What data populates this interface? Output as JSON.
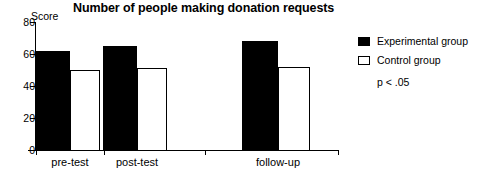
{
  "chart_data": {
    "type": "bar",
    "title": "Number of people making donation requests",
    "xlabel": "",
    "ylabel": "Score",
    "ylim": [
      0,
      80
    ],
    "yticks": [
      0,
      20,
      40,
      60,
      80
    ],
    "ytick_labels": [
      "0",
      "20",
      "40",
      "60",
      "80"
    ],
    "grid": false,
    "legend_position": "right",
    "annotation": "p < .05",
    "categories": [
      "pre-test",
      "post-test",
      "follow-up"
    ],
    "series": [
      {
        "name": "Experimental group",
        "style": "filled-black",
        "color": "#000000",
        "values": [
          62,
          65,
          68
        ]
      },
      {
        "name": "Control group",
        "style": "hollow-white",
        "color": "#ffffff",
        "values": [
          50,
          51,
          52
        ]
      }
    ]
  },
  "axis": {
    "y_title": "Score"
  },
  "legend": {
    "items": [
      {
        "label": "Experimental group",
        "swatch": "filled"
      },
      {
        "label": "Control group",
        "swatch": "hollow"
      }
    ],
    "note": "p < .05"
  }
}
